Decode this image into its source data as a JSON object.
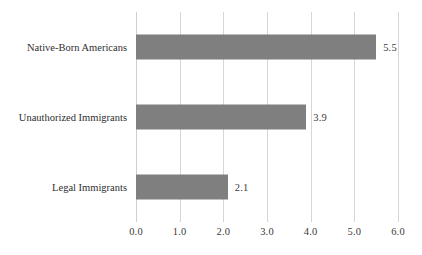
{
  "chart_data": {
    "type": "bar",
    "orientation": "horizontal",
    "title": "",
    "subtitle": "",
    "xlabel": "",
    "ylabel": "",
    "categories": [
      "Native-Born Americans",
      "Unauthorized Immigrants",
      "Legal Immigrants"
    ],
    "values": [
      5.5,
      3.9,
      2.1
    ],
    "value_labels": [
      "5.5",
      "3.9",
      "2.1"
    ],
    "xlim": [
      0.0,
      6.0
    ],
    "xticks": [
      0.0,
      1.0,
      2.0,
      3.0,
      4.0,
      5.0,
      6.0
    ],
    "xtick_labels": [
      "0.0",
      "1.0",
      "2.0",
      "3.0",
      "4.0",
      "5.0",
      "6.0"
    ],
    "grid": "vertical",
    "legend": "none",
    "annotations": [],
    "colors": {
      "bar_fill": "#7f7f7f",
      "gridline": "#d6d6d6",
      "axis_line": "#cfcfcf",
      "text": "#2f2f2f",
      "value_text": "#3a3a3a",
      "background": "#ffffff"
    }
  }
}
